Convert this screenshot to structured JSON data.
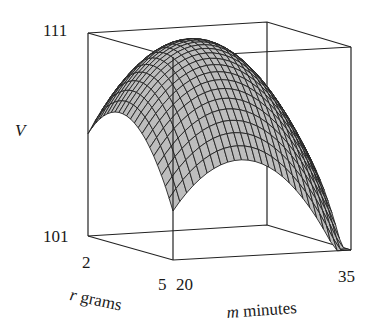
{
  "chart_data": {
    "type": "surface3d",
    "title": "",
    "zlabel": "V",
    "xlabel": "r grams",
    "ylabel": "m minutes",
    "x_var": "r",
    "x_unit": "grams",
    "y_var": "m",
    "y_unit": "minutes",
    "xlim": [
      2,
      5
    ],
    "ylim": [
      20,
      35
    ],
    "zlim": [
      101,
      111
    ],
    "x_ticks": [
      "2",
      "5"
    ],
    "y_ticks": [
      "20",
      "35"
    ],
    "z_ticks": [
      "101",
      "111"
    ],
    "surface_description": "Concave-down dome; maximum near the top of the box (≈111) in the interior, lower along the edges; the corner at r=5, m=20 dips to ≈101.",
    "grid": false,
    "box": true,
    "surface_color": "#bdbdbd",
    "mesh_color": "#222222"
  },
  "labels": {
    "z_axis": "V",
    "z_top": "111",
    "z_bottom": "101",
    "r_min": "2",
    "r_max": "5",
    "m_min": "20",
    "m_max": "35",
    "r_var": "r",
    "r_unit": "grams",
    "m_var": "m",
    "m_unit": "minutes"
  }
}
